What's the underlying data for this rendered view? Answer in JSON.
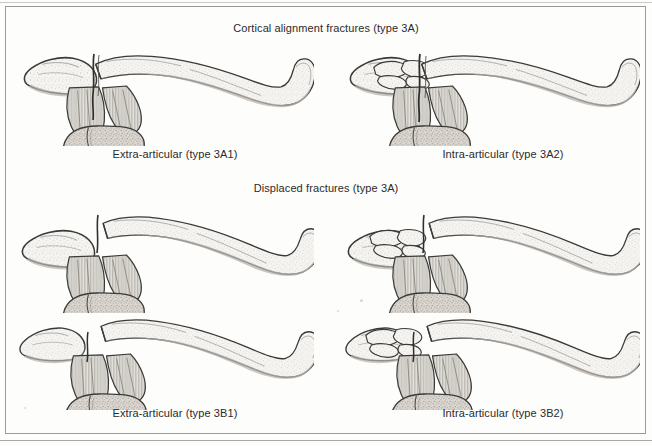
{
  "figure": {
    "background_color": "#fdfdfc",
    "frame_color": "#9a9a9a",
    "ink_color": "#2f2f2f",
    "bone_fill": "#f4f3f0",
    "shadow_fill": "#cfcdc8"
  },
  "headings": [
    {
      "id": "heading-3a",
      "text": "Cortical alignment fractures (type 3A)",
      "x": 326,
      "y": 22
    },
    {
      "id": "heading-3b",
      "text": "Displaced fractures (type 3A)",
      "x": 326,
      "y": 182
    }
  ],
  "panels": [
    {
      "id": "panel-3a1",
      "caption": "Extra-articular (type 3A1)",
      "caption_x": 175,
      "caption_y": 148,
      "row": 1,
      "column": "left",
      "fracture_type": "3A1",
      "description": "cortical-alignment-extra-articular"
    },
    {
      "id": "panel-3a2",
      "caption": "Intra-articular (type 3A2)",
      "caption_x": 503,
      "caption_y": 148,
      "row": 1,
      "column": "right",
      "fracture_type": "3A2",
      "description": "cortical-alignment-intra-articular"
    },
    {
      "id": "panel-3b1-upper",
      "caption": "",
      "row": 2,
      "column": "left",
      "fracture_type": "3B1",
      "description": "displaced-extra-articular-upper"
    },
    {
      "id": "panel-3b2-upper",
      "caption": "",
      "row": 2,
      "column": "right",
      "fracture_type": "3B2",
      "description": "displaced-intra-articular-upper"
    },
    {
      "id": "panel-3b1",
      "caption": "Extra-articular (type 3B1)",
      "caption_x": 175,
      "caption_y": 407,
      "row": 3,
      "column": "left",
      "fracture_type": "3B1",
      "description": "displaced-extra-articular"
    },
    {
      "id": "panel-3b2",
      "caption": "Intra-articular (type 3B2)",
      "caption_x": 503,
      "caption_y": 407,
      "row": 3,
      "column": "right",
      "fracture_type": "3B2",
      "description": "displaced-intra-articular"
    }
  ]
}
